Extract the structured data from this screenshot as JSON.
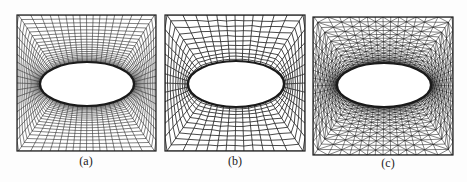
{
  "figure": {
    "background": "#fdfdfd",
    "line_color": "#1a1a1a",
    "panels": [
      {
        "id": "a",
        "caption": "(a)",
        "mesh_type": "structured-quad-radial",
        "box": {
          "x": 17,
          "y": 15,
          "w": 139,
          "h": 136
        },
        "hole": {
          "cx": 87,
          "cy": 84,
          "rx": 47,
          "ry": 22
        },
        "rings": 22,
        "spokes": 64,
        "caption_pos": {
          "x": 86,
          "y": 154
        }
      },
      {
        "id": "b",
        "caption": "(b)",
        "mesh_type": "unstructured-quad",
        "box": {
          "x": 165,
          "y": 15,
          "w": 140,
          "h": 136
        },
        "hole": {
          "cx": 236,
          "cy": 84,
          "rx": 48,
          "ry": 23
        },
        "rings": 11,
        "spokes": 48,
        "caption_pos": {
          "x": 235,
          "y": 154
        }
      },
      {
        "id": "c",
        "caption": "(c)",
        "mesh_type": "unstructured-triangle",
        "box": {
          "x": 313,
          "y": 17,
          "w": 140,
          "h": 138
        },
        "hole": {
          "cx": 384,
          "cy": 85,
          "rx": 47,
          "ry": 22
        },
        "rings": 18,
        "spokes": 56,
        "caption_pos": {
          "x": 388,
          "y": 156
        }
      }
    ]
  }
}
